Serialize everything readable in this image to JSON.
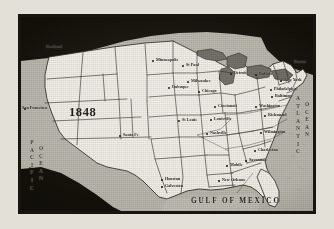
{
  "map": {
    "title_year": "1848",
    "width": 334,
    "height": 229,
    "colors": {
      "frame_rule": "#17150f",
      "paper": "#e3e0d8",
      "land_fill": "#f2efe8",
      "foreign_land": "#121009",
      "ocean_fill": "#b9b6ad",
      "border_line": "#2a2720",
      "city_dot": "#0d0c08"
    },
    "oceans": [
      {
        "name": "pacific-ocean-label",
        "line1": "PACIFIC",
        "line2": "OCEAN",
        "orientation": "vertical",
        "x": 26,
        "y": 135
      },
      {
        "name": "atlantic-ocean-label",
        "line1": "ATLANTIC",
        "line2": "OCEAN",
        "orientation": "vertical",
        "x": 303,
        "y": 96
      }
    ],
    "gulf_label": "GULF OF MEXICO",
    "cities": [
      {
        "label": "Portland",
        "x": 40,
        "y": 45,
        "dx": 7,
        "dy": 0,
        "size": "sm"
      },
      {
        "label": "San Francisco",
        "x": 16,
        "y": 106,
        "dx": 6,
        "dy": 0,
        "size": "sm"
      },
      {
        "label": "Santa Fe",
        "x": 117,
        "y": 133,
        "dx": 0,
        "dy": 0,
        "size": "sm"
      },
      {
        "label": "Minneapolis",
        "x": 150,
        "y": 58,
        "dx": 0,
        "dy": 0,
        "size": "sm"
      },
      {
        "label": "St Paul",
        "x": 180,
        "y": 63,
        "dx": 0,
        "dy": 0,
        "size": "sm"
      },
      {
        "label": "Milwaukee",
        "x": 185,
        "y": 79,
        "dx": 0,
        "dy": 0,
        "size": "sm"
      },
      {
        "label": "Dubuque",
        "x": 166,
        "y": 85,
        "dx": 0,
        "dy": 0,
        "size": "sm"
      },
      {
        "label": "Chicago",
        "x": 196,
        "y": 89,
        "dx": 0,
        "dy": 0,
        "size": "sm"
      },
      {
        "label": "Detroit",
        "x": 228,
        "y": 71,
        "dx": 0,
        "dy": 0,
        "size": "sm"
      },
      {
        "label": "Buffalo",
        "x": 253,
        "y": 72,
        "dx": 0,
        "dy": 0,
        "size": "sm"
      },
      {
        "label": "Boston",
        "x": 288,
        "y": 60,
        "dx": 0,
        "dy": 0,
        "size": "sm"
      },
      {
        "label": "New York",
        "x": 278,
        "y": 78,
        "dx": 0,
        "dy": 0,
        "size": "sm"
      },
      {
        "label": "Philadelphia",
        "x": 268,
        "y": 87,
        "dx": 0,
        "dy": 0,
        "size": "sm"
      },
      {
        "label": "Baltimore",
        "x": 269,
        "y": 94,
        "dx": 0,
        "dy": 0,
        "size": "sm"
      },
      {
        "label": "Washington",
        "x": 253,
        "y": 104,
        "dx": 0,
        "dy": 0,
        "size": "sm"
      },
      {
        "label": "Richmond",
        "x": 262,
        "y": 113,
        "dx": 0,
        "dy": 0,
        "size": "sm"
      },
      {
        "label": "Wilmington",
        "x": 258,
        "y": 130,
        "dx": 0,
        "dy": 0,
        "size": "sm"
      },
      {
        "label": "Charleston",
        "x": 252,
        "y": 148,
        "dx": 0,
        "dy": 0,
        "size": "sm"
      },
      {
        "label": "Savannah",
        "x": 243,
        "y": 158,
        "dx": 0,
        "dy": 0,
        "size": "sm"
      },
      {
        "label": "Cincinnati",
        "x": 212,
        "y": 104,
        "dx": 0,
        "dy": 0,
        "size": "sm"
      },
      {
        "label": "Louisville",
        "x": 208,
        "y": 117,
        "dx": 0,
        "dy": 0,
        "size": "sm"
      },
      {
        "label": "Nashville",
        "x": 204,
        "y": 131,
        "dx": 0,
        "dy": 0,
        "size": "sm"
      },
      {
        "label": "St Louis",
        "x": 176,
        "y": 118,
        "dx": 0,
        "dy": 0,
        "size": "sm"
      },
      {
        "label": "Mobile",
        "x": 224,
        "y": 163,
        "dx": 0,
        "dy": 0,
        "size": "sm"
      },
      {
        "label": "New Orleans",
        "x": 216,
        "y": 178,
        "dx": 0,
        "dy": 0,
        "size": "sm"
      },
      {
        "label": "Houston",
        "x": 159,
        "y": 177,
        "dx": 0,
        "dy": 0,
        "size": "sm"
      },
      {
        "label": "Galveston",
        "x": 159,
        "y": 184,
        "dx": 0,
        "dy": 0,
        "size": "sm"
      }
    ]
  }
}
